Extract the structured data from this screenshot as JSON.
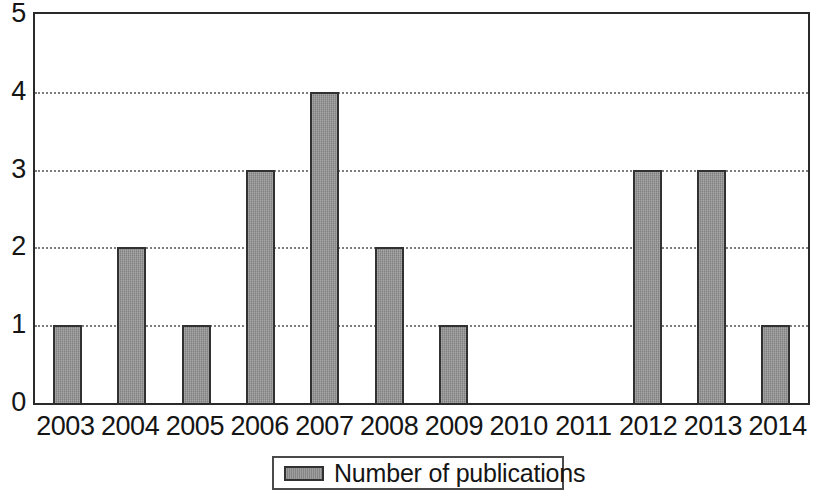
{
  "chart_data": {
    "type": "bar",
    "title": "",
    "subtitle": "",
    "xlabel": "",
    "ylabel": "",
    "categories": [
      "2003",
      "2004",
      "2005",
      "2006",
      "2007",
      "2008",
      "2009",
      "2010",
      "2011",
      "2012",
      "2013",
      "2014"
    ],
    "values": [
      1,
      2,
      1,
      3,
      4,
      2,
      1,
      0,
      0,
      3,
      3,
      1
    ],
    "series": [
      {
        "name": "Number of publications",
        "values": [
          1,
          2,
          1,
          3,
          4,
          2,
          1,
          0,
          0,
          3,
          3,
          1
        ]
      }
    ],
    "ylim": [
      0,
      5
    ],
    "ytick_labels": [
      "0",
      "1",
      "2",
      "3",
      "4",
      "5"
    ],
    "ytick_values": [
      0,
      1,
      2,
      3,
      4,
      5
    ],
    "ytick_interval": 1,
    "xlim_categories": 12,
    "grid": true,
    "grid_axis": "y",
    "grid_style": "dotted",
    "grid_at_values": [
      1,
      2,
      3,
      4
    ],
    "legend_position": "bottom-center",
    "legend_entries": [
      {
        "label": "Number of publications",
        "color": "#8d8d8d"
      }
    ],
    "bar_fill_color": "#8d8d8d",
    "bar_border_color": "#313131",
    "axis_color": "#2a2a2a",
    "gridline_color": "#7d7d7d",
    "background_color": "#ffffff",
    "text_color": "#151515"
  },
  "legend": {
    "label": "Number of publications"
  },
  "y_axis": {
    "ticks": [
      "0",
      "1",
      "2",
      "3",
      "4",
      "5"
    ]
  },
  "x_axis": {
    "ticks": [
      "2003",
      "2004",
      "2005",
      "2006",
      "2007",
      "2008",
      "2009",
      "2010",
      "2011",
      "2012",
      "2013",
      "2014"
    ]
  }
}
